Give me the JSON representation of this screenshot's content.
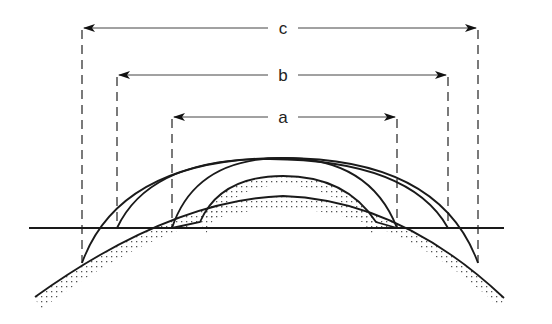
{
  "diagram": {
    "type": "technical line drawing (cross-section of corneal curvature / contact lens fitting)",
    "colors": {
      "line": "#1a1a1a",
      "background": "#ffffff",
      "stipple": "#555555"
    },
    "dimensions": [
      {
        "id": "c",
        "label": "c",
        "y": 28,
        "x_start": 82,
        "x_end": 478
      },
      {
        "id": "b",
        "label": "b",
        "y": 75,
        "x_start": 117,
        "x_end": 448
      },
      {
        "id": "a",
        "label": "a",
        "y": 117,
        "x_start": 172,
        "x_end": 397
      }
    ],
    "baseline": {
      "y": 228,
      "x_start": 29,
      "x_end": 504
    }
  }
}
